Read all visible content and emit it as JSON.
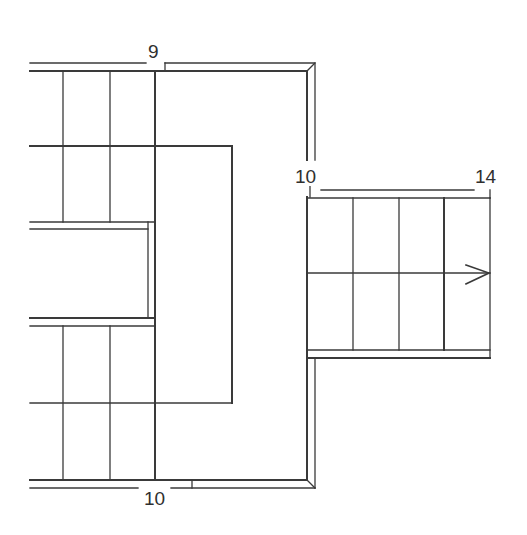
{
  "diagram": {
    "type": "staircase floor plan",
    "colors": {
      "line": "#3a3a3a",
      "background": "#ffffff",
      "text": "#2f2f2f"
    },
    "labels": {
      "top": "9",
      "right_upper": "10",
      "right_stair_end": "14",
      "bottom": "10"
    },
    "elements": [
      {
        "name": "upper-left-flight",
        "treads": "2 rows x 3 columns"
      },
      {
        "name": "landing",
        "shape": "U-shaped landing around central rectangle"
      },
      {
        "name": "lower-left-flight",
        "treads": "2 rows x 3 columns"
      },
      {
        "name": "right-flight",
        "treads": "2 rows x 4 columns",
        "direction_arrow": "right"
      }
    ],
    "arrow_icon": "chevron-right"
  }
}
